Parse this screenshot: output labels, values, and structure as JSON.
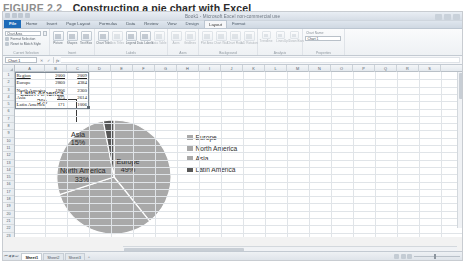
{
  "figure": {
    "label": "FIGURE 2.2",
    "title": "Constructing a pie chart with Excel"
  },
  "window": {
    "title": "Book1 - Microsoft Excel non-commercial use",
    "context_tab_group": "Chart Tools",
    "minimize": "–",
    "maximize": "□",
    "close": "×"
  },
  "ribbon": {
    "tabs": [
      {
        "label": "File",
        "state": "file"
      },
      {
        "label": "Home",
        "state": "normal"
      },
      {
        "label": "Insert",
        "state": "normal"
      },
      {
        "label": "Page Layout",
        "state": "normal"
      },
      {
        "label": "Formulas",
        "state": "normal"
      },
      {
        "label": "Data",
        "state": "normal"
      },
      {
        "label": "Review",
        "state": "normal"
      },
      {
        "label": "View",
        "state": "normal"
      },
      {
        "label": "Design",
        "state": "ctx"
      },
      {
        "label": "Layout",
        "state": "active"
      },
      {
        "label": "Format",
        "state": "ctx"
      }
    ],
    "groups": [
      {
        "name": "Current Selection"
      },
      {
        "name": "Insert"
      },
      {
        "name": "Labels"
      },
      {
        "name": "Axes"
      },
      {
        "name": "Background"
      },
      {
        "name": "Analysis"
      },
      {
        "name": "Properties"
      }
    ],
    "current_selection": {
      "element_box": "Chart Area",
      "format_selection": "Format Selection",
      "reset_style": "Reset to Match Style"
    },
    "insert_buttons": [
      {
        "label": "Picture"
      },
      {
        "label": "Shapes"
      },
      {
        "label": "Text Box"
      }
    ],
    "labels_buttons": [
      {
        "label": "Chart Title"
      },
      {
        "label": "Axis Titles"
      },
      {
        "label": "Legend"
      },
      {
        "label": "Data Labels"
      },
      {
        "label": "Data Table"
      }
    ],
    "axes_buttons": [
      {
        "label": "Axes"
      },
      {
        "label": "Gridlines"
      }
    ],
    "background_buttons": [
      {
        "label": "Plot Area"
      },
      {
        "label": "Chart Wall"
      },
      {
        "label": "Chart Floor"
      },
      {
        "label": "3-D Rotation"
      }
    ],
    "analysis_buttons": [
      {
        "label": "Trendline"
      },
      {
        "label": "Lines"
      },
      {
        "label": "Up/Down Bars"
      },
      {
        "label": "Error Bars"
      }
    ],
    "properties": {
      "caption": "Chart Name:",
      "value": "Chart 1"
    }
  },
  "formula_bar": {
    "name_box": "Chart 1",
    "cancel": "✕",
    "enter": "✓",
    "function_symbol": "fx",
    "value": ""
  },
  "grid": {
    "columns": [
      "A",
      "B",
      "C",
      "D",
      "E",
      "F",
      "G",
      "H",
      "I",
      "J",
      "K",
      "L",
      "M",
      "N",
      "O",
      "P",
      "Q",
      "R",
      "S"
    ],
    "rows": [
      1,
      2,
      3,
      4,
      5,
      6,
      7,
      8,
      9,
      10,
      11,
      12,
      13,
      14,
      15,
      16,
      17,
      18,
      19,
      20,
      21,
      22,
      23,
      24,
      25
    ],
    "data": [
      {
        "row": 1,
        "a": "Region",
        "b": "2000",
        "c": "2009",
        "header": true
      },
      {
        "row": 2,
        "a": "Europe",
        "b": "2860",
        "c": "4384",
        "header": false
      },
      {
        "row": 3,
        "a": "North America",
        "b": "1906",
        "c": "2360",
        "header": false
      },
      {
        "row": 4,
        "a": "Asia",
        "b": "875",
        "c": "2614",
        "header": false
      },
      {
        "row": 5,
        "a": "Latin America",
        "b": "171",
        "c": "1006",
        "header": false
      }
    ]
  },
  "chart_data": {
    "type": "pie",
    "title": "",
    "categories": [
      "Europe",
      "North America",
      "Asia",
      "Latin America"
    ],
    "values": [
      49,
      33,
      15,
      3
    ],
    "value_unit": "percent",
    "source_values": [
      2860,
      1906,
      875,
      171
    ],
    "source_column": "2000",
    "data_labels": [
      {
        "name": "Europe",
        "percent": "49%",
        "placement": "inside"
      },
      {
        "name": "North America",
        "percent": "33%",
        "placement": "inside"
      },
      {
        "name": "Asia",
        "percent": "15%",
        "placement": "inside"
      },
      {
        "name": "Latin America",
        "percent": "3%",
        "placement": "outside-callout"
      }
    ],
    "colors": [
      "#a8a8a8",
      "#a8a8a8",
      "#a8a8a8",
      "#5a5a5a"
    ],
    "legend_position": "right",
    "legend": [
      "Europe",
      "North America",
      "Asia",
      "Latin America"
    ],
    "grid": false
  },
  "sheet_tabs": {
    "nav_first": "⏮",
    "nav_prev": "◀",
    "nav_next": "▶",
    "nav_last": "⏭",
    "tabs": [
      {
        "label": "Sheet1",
        "active": true
      },
      {
        "label": "Sheet2",
        "active": false
      },
      {
        "label": "Sheet3",
        "active": false
      }
    ],
    "new_sheet": "➕"
  },
  "status_bar": {
    "zoom_level": "100%"
  }
}
